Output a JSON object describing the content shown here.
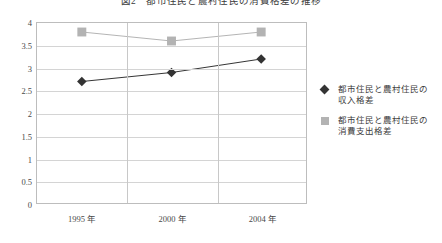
{
  "chart_data": {
    "type": "line",
    "title": "図2　都市住民と農村住民の消費格差の推移",
    "xlabel": "",
    "ylabel": "",
    "categories": [
      "1995 年",
      "2000 年",
      "2004 年"
    ],
    "yticks": [
      "0",
      "0.5",
      "1",
      "1.5",
      "2",
      "2.5",
      "3",
      "3.5",
      "4"
    ],
    "ytick_values": [
      0,
      0.5,
      1,
      1.5,
      2,
      2.5,
      3,
      3.5,
      4
    ],
    "ylim": [
      0,
      4
    ],
    "grid": "horizontal-and-vertical",
    "legend_position": "right",
    "series": [
      {
        "name": "都市住民と農村住民の収入格差",
        "name_line1": "都市住民と農村住民の",
        "name_line2": "収入格差",
        "marker": "diamond",
        "color": "#333333",
        "values": [
          2.7,
          2.9,
          3.2
        ]
      },
      {
        "name": "都市住民と農村住民の消費支出格差",
        "name_line1": "都市住民と農村住民の",
        "name_line2": "消費支出格差",
        "marker": "square",
        "color": "#b3b3b3",
        "values": [
          3.8,
          3.6,
          3.8
        ]
      }
    ]
  },
  "colors": {
    "series_income": "#333333",
    "series_expense": "#b3b3b3",
    "grid": "#d4d4d4",
    "frame": "#bdbdbd",
    "text": "#404040",
    "background": "#ffffff"
  }
}
